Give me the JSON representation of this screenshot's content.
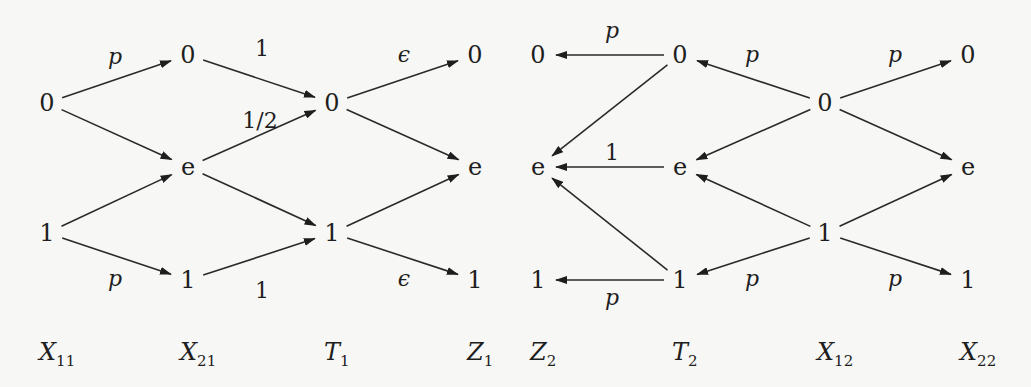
{
  "diagram": {
    "type": "bit-channel transition diagram",
    "columns": [
      {
        "id": "X11",
        "base": "X",
        "sub": "11",
        "x": 47
      },
      {
        "id": "X21",
        "base": "X",
        "sub": "21",
        "x": 188
      },
      {
        "id": "T1",
        "base": "T",
        "sub": "1",
        "x": 332
      },
      {
        "id": "Z1",
        "base": "Z",
        "sub": "1",
        "x": 475
      },
      {
        "id": "Z2",
        "base": "Z",
        "sub": "2",
        "x": 538
      },
      {
        "id": "T2",
        "base": "T",
        "sub": "2",
        "x": 680
      },
      {
        "id": "X12",
        "base": "X",
        "sub": "12",
        "x": 825
      },
      {
        "id": "X22",
        "base": "X",
        "sub": "22",
        "x": 968
      }
    ],
    "nodes": [
      {
        "id": "X11_0",
        "col": "X11",
        "label": "0",
        "y": 103
      },
      {
        "id": "X11_1",
        "col": "X11",
        "label": "1",
        "y": 233
      },
      {
        "id": "X21_0",
        "col": "X21",
        "label": "0",
        "y": 55
      },
      {
        "id": "X21_e",
        "col": "X21",
        "label": "e",
        "y": 167
      },
      {
        "id": "X21_1",
        "col": "X21",
        "label": "1",
        "y": 280
      },
      {
        "id": "T1_0",
        "col": "T1",
        "label": "0",
        "y": 103
      },
      {
        "id": "T1_1",
        "col": "T1",
        "label": "1",
        "y": 233
      },
      {
        "id": "Z1_0",
        "col": "Z1",
        "label": "0",
        "y": 55
      },
      {
        "id": "Z1_e",
        "col": "Z1",
        "label": "e",
        "y": 167
      },
      {
        "id": "Z1_1",
        "col": "Z1",
        "label": "1",
        "y": 280
      },
      {
        "id": "Z2_0",
        "col": "Z2",
        "label": "0",
        "y": 55
      },
      {
        "id": "Z2_e",
        "col": "Z2",
        "label": "e",
        "y": 167
      },
      {
        "id": "Z2_1",
        "col": "Z2",
        "label": "1",
        "y": 280
      },
      {
        "id": "T2_0",
        "col": "T2",
        "label": "0",
        "y": 55
      },
      {
        "id": "T2_e",
        "col": "T2",
        "label": "e",
        "y": 167
      },
      {
        "id": "T2_1",
        "col": "T2",
        "label": "1",
        "y": 280
      },
      {
        "id": "X12_0",
        "col": "X12",
        "label": "0",
        "y": 103
      },
      {
        "id": "X12_1",
        "col": "X12",
        "label": "1",
        "y": 233
      },
      {
        "id": "X22_0",
        "col": "X22",
        "label": "0",
        "y": 55
      },
      {
        "id": "X22_e",
        "col": "X22",
        "label": "e",
        "y": 167
      },
      {
        "id": "X22_1",
        "col": "X22",
        "label": "1",
        "y": 280
      }
    ],
    "edges": [
      {
        "from": "X11_0",
        "to": "X21_0",
        "label": "p",
        "italic": true
      },
      {
        "from": "X11_0",
        "to": "X21_e",
        "label": ""
      },
      {
        "from": "X11_1",
        "to": "X21_e",
        "label": ""
      },
      {
        "from": "X11_1",
        "to": "X21_1",
        "label": "p",
        "italic": true
      },
      {
        "from": "X21_0",
        "to": "T1_0",
        "label": "1",
        "italic": false
      },
      {
        "from": "X21_e",
        "to": "T1_0",
        "label": "1/2",
        "italic": false
      },
      {
        "from": "X21_e",
        "to": "T1_1",
        "label": ""
      },
      {
        "from": "X21_1",
        "to": "T1_1",
        "label": "1",
        "italic": false
      },
      {
        "from": "T1_0",
        "to": "Z1_0",
        "label": "ϵ",
        "italic": true
      },
      {
        "from": "T1_0",
        "to": "Z1_e",
        "label": ""
      },
      {
        "from": "T1_1",
        "to": "Z1_e",
        "label": ""
      },
      {
        "from": "T1_1",
        "to": "Z1_1",
        "label": "ϵ",
        "italic": true
      },
      {
        "from": "T2_0",
        "to": "Z2_0",
        "label": "p",
        "italic": true
      },
      {
        "from": "T2_0",
        "to": "Z2_e",
        "label": ""
      },
      {
        "from": "T2_e",
        "to": "Z2_e",
        "label": "1",
        "italic": false
      },
      {
        "from": "T2_1",
        "to": "Z2_e",
        "label": ""
      },
      {
        "from": "T2_1",
        "to": "Z2_1",
        "label": "p",
        "italic": true
      },
      {
        "from": "X12_0",
        "to": "T2_0",
        "label": "p",
        "italic": true
      },
      {
        "from": "X12_0",
        "to": "T2_e",
        "label": ""
      },
      {
        "from": "X12_1",
        "to": "T2_e",
        "label": ""
      },
      {
        "from": "X12_1",
        "to": "T2_1",
        "label": "p",
        "italic": true
      },
      {
        "from": "X12_0",
        "to": "X22_0",
        "label": "p",
        "italic": true
      },
      {
        "from": "X12_0",
        "to": "X22_e",
        "label": ""
      },
      {
        "from": "X12_1",
        "to": "X22_e",
        "label": ""
      },
      {
        "from": "X12_1",
        "to": "X22_1",
        "label": "p",
        "italic": true
      }
    ],
    "edge_labels": [
      {
        "text": "p",
        "italic": true,
        "x": 115,
        "y": 64
      },
      {
        "text": "p",
        "italic": true,
        "x": 115,
        "y": 286
      },
      {
        "text": "1",
        "italic": false,
        "x": 262,
        "y": 56
      },
      {
        "text": "1/2",
        "italic": false,
        "x": 260,
        "y": 128
      },
      {
        "text": "1",
        "italic": false,
        "x": 262,
        "y": 298
      },
      {
        "text": "ϵ",
        "italic": true,
        "x": 404,
        "y": 62
      },
      {
        "text": "ϵ",
        "italic": true,
        "x": 404,
        "y": 286
      },
      {
        "text": "p",
        "italic": true,
        "x": 612,
        "y": 38
      },
      {
        "text": "1",
        "italic": false,
        "x": 612,
        "y": 160
      },
      {
        "text": "p",
        "italic": true,
        "x": 612,
        "y": 305
      },
      {
        "text": "p",
        "italic": true,
        "x": 752,
        "y": 62
      },
      {
        "text": "p",
        "italic": true,
        "x": 752,
        "y": 286
      },
      {
        "text": "p",
        "italic": true,
        "x": 895,
        "y": 62
      },
      {
        "text": "p",
        "italic": true,
        "x": 895,
        "y": 286
      }
    ]
  }
}
